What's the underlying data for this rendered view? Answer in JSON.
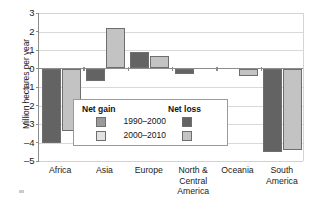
{
  "chart_data": {
    "type": "bar",
    "title": "",
    "xlabel": "",
    "ylabel": "Million hectares per year",
    "ylim": [
      -5,
      3
    ],
    "yticks": [
      3,
      2,
      1,
      0,
      -1,
      -2,
      -3,
      -4,
      -5
    ],
    "ytick_labels": [
      "3",
      "2",
      "1",
      "0",
      "–1",
      "–2",
      "–3",
      "–4",
      "–5"
    ],
    "grid": true,
    "legend_position": "inside-center-left",
    "categories": [
      "Africa",
      "Asia",
      "Europe",
      "North &\nCentral\nAmerica",
      "Oceania",
      "South\nAmerica"
    ],
    "series": [
      {
        "name": "1990–2000",
        "values": [
          -4.0,
          -0.7,
          0.9,
          -0.3,
          0.0,
          -4.5
        ]
      },
      {
        "name": "2000–2010",
        "values": [
          -3.4,
          2.2,
          0.7,
          0.0,
          -0.4,
          -4.4
        ]
      }
    ],
    "legend": {
      "gain_heading": "Net gain",
      "loss_heading": "Net loss",
      "entries": [
        {
          "label": "1990–2000",
          "gain_color": "#9a9a9a",
          "loss_color": "#636363"
        },
        {
          "label": "2000–2010",
          "gain_color": "#e2e2e2",
          "loss_color": "#c3c3c3"
        }
      ]
    },
    "colors": {
      "series_1990_2000": "#636363",
      "series_2000_2010": "#c3c3c3",
      "gridline": "#d9d9d9",
      "axis": "#8d8d8d",
      "text": "#1a1a1a",
      "background": "#ffffff"
    }
  }
}
